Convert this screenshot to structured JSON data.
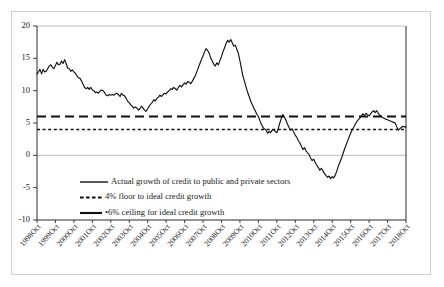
{
  "chart_data": {
    "type": "line",
    "title": "",
    "subtitle": "",
    "xlabel": "",
    "ylabel": "",
    "ylim": [
      -10,
      20
    ],
    "yticks": [
      20,
      15,
      10,
      5,
      0,
      -5,
      -10
    ],
    "ytick_labels": [
      "20",
      "15",
      "10",
      "5",
      "0",
      "-5",
      "-10"
    ],
    "grid": "horizontal-zero-and-top",
    "legend_position": "inside-lower-center",
    "xlim": [
      "1998Oct",
      "2018Oct"
    ],
    "xtick_labels": [
      "1998Oct",
      "1999Oct",
      "2000Oct",
      "2001Oct",
      "2002Oct",
      "2003Oct",
      "2004Oct",
      "2005Oct",
      "2006Oct",
      "2007Oct",
      "2008Oct",
      "2009Oct",
      "2010Oct",
      "2011Oct",
      "2012Oct",
      "2013Oct",
      "2014Oct",
      "2015Oct",
      "2016Oct",
      "2017Oct",
      "2018Oct"
    ],
    "series": [
      {
        "name": "Actual growth of credit to public and private sectors",
        "style": "solid",
        "color": "#111111",
        "x": [
          1998.79,
          1998.87,
          1998.95,
          1999.04,
          1999.12,
          1999.2,
          1999.29,
          1999.37,
          1999.45,
          1999.54,
          1999.62,
          1999.7,
          1999.79,
          1999.87,
          1999.95,
          2000.04,
          2000.12,
          2000.2,
          2000.29,
          2000.37,
          2000.45,
          2000.54,
          2000.62,
          2000.7,
          2000.79,
          2000.87,
          2000.95,
          2001.04,
          2001.12,
          2001.2,
          2001.29,
          2001.37,
          2001.45,
          2001.54,
          2001.62,
          2001.7,
          2001.79,
          2001.87,
          2001.95,
          2002.04,
          2002.12,
          2002.2,
          2002.29,
          2002.37,
          2002.45,
          2002.54,
          2002.62,
          2002.7,
          2002.79,
          2002.87,
          2002.95,
          2003.04,
          2003.12,
          2003.2,
          2003.29,
          2003.37,
          2003.45,
          2003.54,
          2003.62,
          2003.7,
          2003.79,
          2003.87,
          2003.95,
          2004.04,
          2004.12,
          2004.2,
          2004.29,
          2004.37,
          2004.45,
          2004.54,
          2004.62,
          2004.7,
          2004.79,
          2004.87,
          2004.95,
          2005.04,
          2005.12,
          2005.2,
          2005.29,
          2005.37,
          2005.45,
          2005.54,
          2005.62,
          2005.7,
          2005.79,
          2005.87,
          2005.95,
          2006.04,
          2006.12,
          2006.2,
          2006.29,
          2006.37,
          2006.45,
          2006.54,
          2006.62,
          2006.7,
          2006.79,
          2006.87,
          2006.95,
          2007.04,
          2007.12,
          2007.2,
          2007.29,
          2007.37,
          2007.45,
          2007.54,
          2007.62,
          2007.7,
          2007.79,
          2007.87,
          2007.95,
          2008.04,
          2008.12,
          2008.2,
          2008.29,
          2008.37,
          2008.45,
          2008.54,
          2008.62,
          2008.7,
          2008.79,
          2008.87,
          2008.95,
          2009.04,
          2009.12,
          2009.2,
          2009.29,
          2009.37,
          2009.45,
          2009.54,
          2009.62,
          2009.7,
          2009.79,
          2009.87,
          2009.95,
          2010.04,
          2010.12,
          2010.2,
          2010.29,
          2010.37,
          2010.45,
          2010.54,
          2010.62,
          2010.7,
          2010.79,
          2010.87,
          2010.95,
          2011.04,
          2011.12,
          2011.2,
          2011.29,
          2011.37,
          2011.45,
          2011.54,
          2011.62,
          2011.7,
          2011.79,
          2011.87,
          2011.95,
          2012.04,
          2012.12,
          2012.2,
          2012.29,
          2012.37,
          2012.45,
          2012.54,
          2012.62,
          2012.7,
          2012.79,
          2012.87,
          2012.95,
          2013.04,
          2013.12,
          2013.2,
          2013.29,
          2013.37,
          2013.45,
          2013.54,
          2013.62,
          2013.7,
          2013.79,
          2013.87,
          2013.95,
          2014.04,
          2014.12,
          2014.2,
          2014.29,
          2014.37,
          2014.45,
          2014.54,
          2014.62,
          2014.7,
          2014.79,
          2014.87,
          2014.95,
          2015.04,
          2015.12,
          2015.2,
          2015.29,
          2015.37,
          2015.45,
          2015.54,
          2015.62,
          2015.7,
          2015.79,
          2015.87,
          2015.95,
          2016.04,
          2016.12,
          2016.2,
          2016.29,
          2016.37,
          2016.45,
          2016.54,
          2016.62,
          2016.7,
          2016.79,
          2016.87,
          2016.95,
          2017.04,
          2017.12,
          2017.2,
          2017.29,
          2017.37,
          2017.45,
          2017.54,
          2017.62,
          2017.7,
          2017.79,
          2017.87,
          2017.95,
          2018.04,
          2018.12,
          2018.2,
          2018.29,
          2018.37,
          2018.45,
          2018.54,
          2018.62,
          2018.7,
          2018.79
        ],
        "values": [
          12.6,
          12.9,
          13.3,
          12.6,
          13.3,
          12.9,
          13.0,
          13.4,
          13.8,
          14.0,
          13.6,
          13.4,
          13.9,
          14.4,
          14.0,
          14.1,
          14.6,
          14.2,
          14.8,
          14.2,
          13.5,
          13.4,
          13.0,
          13.2,
          12.9,
          12.7,
          12.3,
          12.0,
          11.9,
          11.5,
          11.0,
          10.5,
          10.3,
          10.5,
          10.2,
          10.5,
          10.1,
          10.0,
          9.7,
          9.8,
          9.6,
          9.9,
          10.1,
          10.0,
          9.7,
          9.3,
          9.2,
          9.4,
          9.3,
          9.4,
          9.3,
          9.5,
          9.6,
          9.4,
          9.1,
          9.6,
          9.3,
          9.2,
          8.8,
          8.4,
          8.1,
          7.8,
          7.6,
          7.3,
          7.5,
          7.3,
          7.0,
          7.2,
          7.6,
          7.3,
          7.0,
          6.8,
          7.2,
          7.6,
          7.9,
          8.2,
          8.6,
          8.4,
          8.8,
          9.0,
          9.3,
          9.1,
          9.4,
          9.6,
          9.5,
          9.8,
          10.0,
          10.3,
          10.2,
          10.5,
          10.3,
          10.1,
          10.5,
          10.8,
          10.6,
          10.9,
          11.2,
          11.0,
          11.4,
          11.3,
          11.1,
          11.4,
          11.9,
          12.3,
          12.9,
          13.6,
          14.2,
          14.8,
          15.4,
          16.0,
          16.5,
          16.2,
          15.8,
          15.1,
          14.6,
          14.1,
          13.8,
          14.3,
          14.0,
          14.6,
          15.3,
          16.0,
          16.6,
          17.3,
          17.8,
          17.5,
          17.9,
          17.4,
          16.9,
          17.0,
          16.4,
          15.8,
          14.6,
          13.4,
          12.3,
          11.4,
          10.6,
          9.8,
          9.1,
          8.4,
          7.9,
          7.3,
          6.9,
          6.4,
          6.0,
          5.4,
          4.8,
          4.3,
          4.1,
          3.9,
          3.4,
          3.7,
          3.5,
          3.9,
          4.0,
          3.7,
          3.5,
          4.2,
          5.0,
          5.8,
          6.3,
          5.9,
          5.4,
          4.8,
          4.3,
          3.9,
          4.1,
          3.6,
          3.1,
          2.8,
          2.3,
          1.9,
          1.4,
          0.9,
          1.2,
          0.7,
          0.4,
          0.1,
          -0.4,
          -0.8,
          -0.6,
          -1.1,
          -1.5,
          -1.9,
          -2.3,
          -2.0,
          -2.4,
          -2.8,
          -3.1,
          -3.4,
          -3.2,
          -3.6,
          -3.3,
          -3.5,
          -3.1,
          -2.4,
          -1.7,
          -1.1,
          -0.5,
          0.2,
          0.9,
          1.6,
          2.2,
          2.8,
          3.4,
          3.9,
          4.3,
          4.8,
          5.2,
          5.5,
          5.8,
          6.1,
          6.4,
          6.2,
          6.5,
          6.3,
          6.1,
          6.4,
          6.7,
          6.9,
          6.6,
          6.9,
          6.5,
          6.2,
          6.0,
          5.8,
          5.7,
          5.6,
          5.5,
          5.4,
          5.3,
          5.2,
          5.1,
          5.0,
          4.4,
          3.9,
          4.1,
          4.3,
          4.5,
          4.4,
          4.4
        ]
      },
      {
        "name": "4% floor to ideal credit growth",
        "style": "dotted",
        "color": "#111111",
        "constant": 4
      },
      {
        "name": "•6% ceiling for ideal credit growth",
        "style": "dashed",
        "color": "#111111",
        "constant": 6
      }
    ],
    "legend_entries": [
      {
        "label": "Actual growth of credit to public and private sectors",
        "style": "solid"
      },
      {
        "label": "4% floor to ideal credit growth",
        "style": "dashed-short"
      },
      {
        "label": "•6% ceiling for ideal credit growth",
        "style": "solid-thick"
      }
    ]
  }
}
